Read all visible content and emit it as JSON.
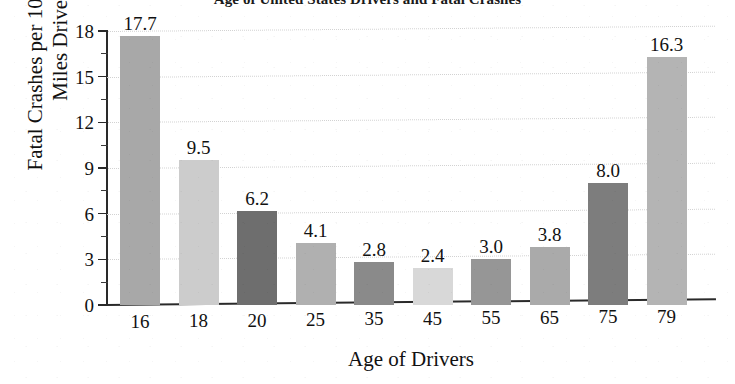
{
  "chart_data": {
    "type": "bar",
    "title": "Age of United States Drivers and Fatal Crashes",
    "xlabel": "Age of Drivers",
    "ylabel": "Fatal Crashes per 100 Million Miles Driven",
    "categories": [
      "16",
      "18",
      "20",
      "25",
      "35",
      "45",
      "55",
      "65",
      "75",
      "79"
    ],
    "values": [
      17.7,
      9.5,
      6.2,
      4.1,
      2.8,
      2.4,
      3.0,
      3.8,
      8.0,
      16.3
    ],
    "value_labels": [
      "17.7",
      "9.5",
      "6.2",
      "4.1",
      "2.8",
      "2.4",
      "3.0",
      "3.8",
      "8.0",
      "16.3"
    ],
    "bar_colors": [
      "#a8a8a8",
      "#cccccc",
      "#6e6e6e",
      "#b0b0b0",
      "#8a8a8a",
      "#d8d8d8",
      "#969696",
      "#aaaaaa",
      "#7d7d7d",
      "#b4b4b4"
    ],
    "ylim": [
      0,
      18
    ],
    "ytick_labels": [
      "0",
      "3",
      "6",
      "9",
      "12",
      "15",
      "18"
    ],
    "ytick_values": [
      0,
      3,
      6,
      9,
      12,
      15,
      18
    ],
    "yminor_values": [
      1.5,
      4.5,
      7.5,
      10.5,
      13.5,
      16.5
    ],
    "grid": true,
    "grid_axis": "y",
    "legend": "none"
  }
}
